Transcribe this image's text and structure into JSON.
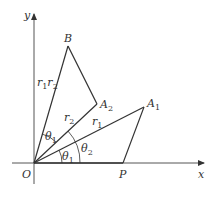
{
  "diagram": {
    "type": "geometric construction (complex multiplication)",
    "axes": {
      "x_label": "x",
      "y_label": "y",
      "origin_label": "O"
    },
    "points": {
      "O": {
        "label": "O",
        "x": 34,
        "y": 163
      },
      "P": {
        "label": "P",
        "x": 123,
        "y": 163
      },
      "A1": {
        "label": "A",
        "sub": "1",
        "x": 144,
        "y": 107
      },
      "A2": {
        "label": "A",
        "sub": "2",
        "x": 97,
        "y": 104
      },
      "B": {
        "label": "B",
        "x": 68,
        "y": 46
      }
    },
    "segment_labels": {
      "r1": {
        "label": "r",
        "sub": "1"
      },
      "r2": {
        "label": "r",
        "sub": "2"
      },
      "r1r2": {
        "label": "r",
        "sub1": "1",
        "label2": "r",
        "sub2": "2"
      }
    },
    "angle_labels": {
      "theta1_bottom": {
        "label": "θ",
        "sub": "1"
      },
      "theta2": {
        "label": "θ",
        "sub": "2"
      },
      "theta1_top": {
        "label": "θ",
        "sub": "1"
      }
    },
    "colors": {
      "line": "#333333",
      "axis": "#555555",
      "background": "#ffffff"
    }
  }
}
